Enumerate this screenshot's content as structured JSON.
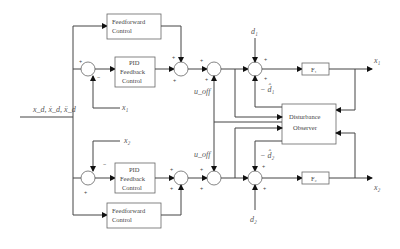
{
  "diagram": {
    "type": "control-block-diagram",
    "input_label": "x_d, ẋ_d, ẍ_d",
    "blocks": {
      "ff_top_line1": "Feedforward",
      "ff_top_line2": "Control",
      "pid_top_line1": "PID",
      "pid_top_line2": "Feedback",
      "pid_top_line3": "Control",
      "pid_bot_line1": "PID",
      "pid_bot_line2": "Feedback",
      "pid_bot_line3": "Control",
      "ff_bot_line1": "Feedforward",
      "ff_bot_line2": "Control",
      "plant_top": "F₁",
      "plant_bot": "F₂",
      "observer_line1": "Disturbance",
      "observer_line2": "Observer"
    },
    "signals": {
      "x1_feedback": "x₁",
      "x2_feedback": "x₂",
      "x1_output": "x₁",
      "x2_output": "x₂",
      "u_off_top": "u_off",
      "u_off_bot": "u_off",
      "d1": "d₁",
      "d2": "d₂",
      "d1_hat": "− d̂₁",
      "d2_hat": "− d̂₂"
    },
    "signs": {
      "plus": "+",
      "minus": "−"
    }
  }
}
